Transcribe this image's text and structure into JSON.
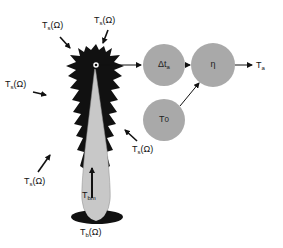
{
  "diagram": {
    "type": "radiometer antenna temperature model",
    "colors": {
      "pattern": "#111111",
      "main_beam": "#c8c8c8",
      "node_fill": "#a9a9a9",
      "arrow": "#111111"
    },
    "incident_labels": [
      {
        "id": "ts-top-left",
        "base": "T",
        "sub": "s",
        "suffix": "(Ω)"
      },
      {
        "id": "ts-top-right",
        "base": "T",
        "sub": "s",
        "suffix": "(Ω)"
      },
      {
        "id": "ts-left",
        "base": "T",
        "sub": "s",
        "suffix": "(Ω)"
      },
      {
        "id": "ts-bottom-left",
        "base": "T",
        "sub": "s",
        "suffix": "(Ω)"
      },
      {
        "id": "ts-right",
        "base": "T",
        "sub": "s",
        "suffix": "(Ω)"
      }
    ],
    "beam_label": {
      "base": "T",
      "sub": "bm"
    },
    "ground_label": {
      "base": "T",
      "sub": "b",
      "suffix": "(Ω)"
    },
    "nodes": [
      {
        "id": "delta-ta",
        "base": "Δt",
        "sub": "a"
      },
      {
        "id": "eta",
        "base": "η",
        "sub": ""
      },
      {
        "id": "t0",
        "base": "T",
        "sub": "0"
      }
    ],
    "output_label": {
      "base": "T",
      "sub": "a"
    }
  }
}
